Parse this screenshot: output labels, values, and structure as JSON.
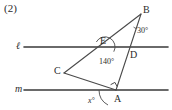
{
  "figure": {
    "problem_number": "(2)",
    "canvas": {
      "width": 172,
      "height": 110,
      "background": "#ffffff"
    },
    "stroke_color": "#3a3a3a",
    "label_color": "#2b2b2b",
    "lines": [
      {
        "name": "l",
        "label": "ℓ",
        "label_x": 16,
        "label_y": 41,
        "y": 47,
        "x1": 24,
        "x2": 168
      },
      {
        "name": "m",
        "label": "m",
        "label_x": 15,
        "label_y": 84,
        "y": 90,
        "x1": 24,
        "x2": 168
      }
    ],
    "points": [
      {
        "id": "B",
        "label": "B",
        "x": 141,
        "y": 14,
        "label_x": 143,
        "label_y": 5
      },
      {
        "id": "E",
        "label": "E",
        "x": 105,
        "y": 47,
        "label_x": 100,
        "label_y": 36
      },
      {
        "id": "D",
        "label": "D",
        "x": 128,
        "y": 52,
        "label_x": 130,
        "label_y": 50
      },
      {
        "id": "C",
        "label": "C",
        "x": 64,
        "y": 73,
        "label_x": 54,
        "label_y": 66
      },
      {
        "id": "A",
        "label": "A",
        "x": 116,
        "y": 90,
        "label_x": 114,
        "label_y": 94
      }
    ],
    "segments": [
      {
        "name": "segment-BC",
        "from": "B",
        "to": "C"
      },
      {
        "name": "segment-BA",
        "from": "B",
        "to": "A"
      },
      {
        "name": "segment-CA",
        "from": "C",
        "to": "A"
      }
    ],
    "angles": [
      {
        "id": "angle-B",
        "vertex": "B",
        "value": "30",
        "unit": "°",
        "label": "30°",
        "label_x": 137,
        "label_y": 27,
        "arc": {
          "cx": 141,
          "cy": 14,
          "r": 15,
          "start_deg": 240,
          "end_deg": 269
        }
      },
      {
        "id": "angle-E",
        "vertex": "E",
        "value": "140",
        "unit": "°",
        "label": "140°",
        "label_x": 103,
        "label_y": 58,
        "arc": {
          "cx": 105,
          "cy": 47,
          "r": 10,
          "start_deg": 28,
          "end_deg": 150
        }
      },
      {
        "id": "angle-A-right",
        "vertex": "A",
        "value": "90",
        "unit": "°",
        "label": "",
        "marker": "right-angle-square"
      },
      {
        "id": "angle-x",
        "vertex": "A",
        "value": "x",
        "unit": "°",
        "label": "x°",
        "label_x": 88,
        "label_y": 98,
        "arc": {
          "cx": 116,
          "cy": 90,
          "r": 17,
          "start_deg": 180,
          "end_deg": 242
        }
      }
    ]
  }
}
